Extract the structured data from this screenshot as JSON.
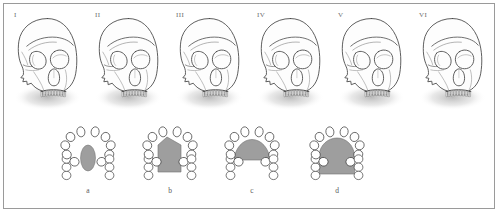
{
  "figure": {
    "type": "anatomical-plate",
    "border_color": "#9a9a9a",
    "background_color": "#ffffff",
    "outline_color": "#4a4a4a",
    "shade_color": "#9e9e9e",
    "shadow_color": "#cfcfcf"
  },
  "skull_row": {
    "panels": [
      {
        "label": "I",
        "orbit_shading": "none",
        "nasal_shading": "none"
      },
      {
        "label": "II",
        "orbit_shading": "none",
        "nasal_shading": "none"
      },
      {
        "label": "III",
        "orbit_shading": "light",
        "nasal_shading": "none"
      },
      {
        "label": "IV",
        "orbit_shading": "medium",
        "nasal_shading": "none"
      },
      {
        "label": "V",
        "orbit_shading": "dark",
        "nasal_shading": "light"
      },
      {
        "label": "VI",
        "orbit_shading": "none",
        "nasal_shading": "dark"
      }
    ]
  },
  "arch_row": {
    "items": [
      {
        "label": "a",
        "palate_shape": "small-ellipse",
        "tooth_count": 16
      },
      {
        "label": "b",
        "palate_shape": "narrow-pentagon",
        "tooth_count": 16
      },
      {
        "label": "c",
        "palate_shape": "wide-dome",
        "tooth_count": 16
      },
      {
        "label": "d",
        "palate_shape": "large-full",
        "tooth_count": 16
      }
    ]
  },
  "chart_data": {
    "type": "table",
    "title": "",
    "series": [
      {
        "name": "skull-panels",
        "categories": [
          "I",
          "II",
          "III",
          "IV",
          "V",
          "VI"
        ],
        "values": [
          0,
          0,
          1,
          2,
          3,
          3
        ]
      },
      {
        "name": "palate-shading-extent",
        "categories": [
          "a",
          "b",
          "c",
          "d"
        ],
        "values": [
          1,
          2,
          3,
          4
        ]
      }
    ]
  }
}
